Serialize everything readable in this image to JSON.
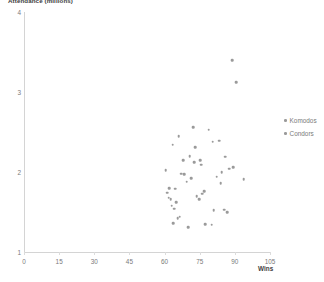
{
  "chart_data": {
    "type": "scatter",
    "title": "",
    "ylabel": "Attendance (millions)",
    "xlabel": "Wins",
    "xlim": [
      0,
      105
    ],
    "ylim": [
      1,
      4
    ],
    "xticks": [
      0,
      15,
      30,
      45,
      60,
      75,
      90,
      105
    ],
    "yticks": [
      1,
      2,
      3,
      4
    ],
    "grid": false,
    "legend_position": "right",
    "colors": {
      "komodos": "#9a9a9a",
      "condors": "#9a9a9a",
      "axis": "#d4d4d4",
      "text": "#7a7a7a"
    },
    "series": [
      {
        "name": "Komodos",
        "points": [
          [
            88.8,
            3.4
          ],
          [
            90.5,
            3.12
          ],
          [
            72.2,
            2.56
          ],
          [
            78.8,
            2.53
          ],
          [
            66.0,
            2.45
          ],
          [
            83.4,
            2.39
          ],
          [
            63.5,
            2.34
          ],
          [
            73.0,
            2.31
          ],
          [
            70.7,
            2.2
          ],
          [
            75.2,
            2.15
          ],
          [
            75.6,
            2.09
          ],
          [
            89.4,
            2.06
          ],
          [
            86.0,
            2.19
          ],
          [
            84.3,
            2.0
          ],
          [
            82.2,
            1.94
          ],
          [
            67.2,
            1.98
          ],
          [
            68.5,
            1.97
          ],
          [
            71.4,
            1.92
          ],
          [
            64.5,
            1.79
          ],
          [
            77.0,
            1.76
          ],
          [
            76.1,
            1.73
          ],
          [
            62.0,
            1.8
          ],
          [
            61.2,
            1.74
          ],
          [
            65.0,
            1.62
          ],
          [
            63.0,
            1.58
          ],
          [
            85.5,
            1.53
          ],
          [
            86.8,
            1.5
          ]
        ]
      },
      {
        "name": "Condors",
        "points": [
          [
            80.6,
            2.38
          ],
          [
            68.0,
            2.15
          ],
          [
            72.6,
            2.12
          ],
          [
            87.6,
            2.04
          ],
          [
            60.5,
            2.02
          ],
          [
            93.8,
            1.91
          ],
          [
            84.0,
            1.86
          ],
          [
            69.4,
            1.88
          ],
          [
            73.8,
            1.7
          ],
          [
            74.8,
            1.66
          ],
          [
            61.8,
            1.68
          ],
          [
            62.6,
            1.66
          ],
          [
            64.0,
            1.54
          ],
          [
            66.4,
            1.44
          ],
          [
            65.6,
            1.42
          ],
          [
            81.0,
            1.52
          ],
          [
            63.8,
            1.36
          ],
          [
            77.4,
            1.35
          ],
          [
            80.2,
            1.34
          ],
          [
            70.2,
            1.31
          ]
        ]
      }
    ]
  },
  "legend": {
    "items": [
      {
        "label": "Komodos"
      },
      {
        "label": "Condors"
      }
    ]
  }
}
